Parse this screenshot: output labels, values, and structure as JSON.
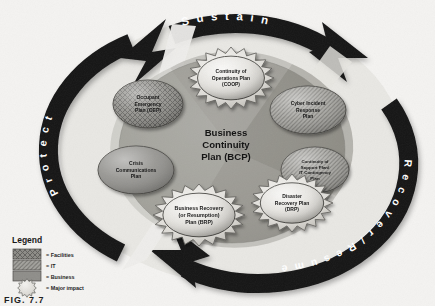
{
  "figure": {
    "caption": "FIG. 7.7",
    "center_title_lines": [
      "Business",
      "Continuity",
      "Plan (BCP)"
    ]
  },
  "ring": {
    "sustain_label": "S u s t a i n",
    "protect_label": "P r o t e c t",
    "recover_label": "R e c o v e r  /  R e s u m e",
    "ring_color": "#1a1a1a",
    "ring_text_color": "#ffffff"
  },
  "center": {
    "disc_color": "#9a9a96",
    "wedge_light": "#b9b8b3",
    "wedge_dark": "#86857f"
  },
  "nodes": [
    {
      "id": "coop",
      "lines": [
        "Continuity of",
        "Operations Plan",
        "(COOP)"
      ],
      "pattern": "facilities",
      "major_impact": true,
      "cx": 231,
      "cy": 78,
      "rx": 38,
      "ry": 26
    },
    {
      "id": "oep",
      "lines": [
        "Occupant",
        "Emergency",
        "Plan (OEP)"
      ],
      "pattern": "facilities",
      "major_impact": false,
      "cx": 148,
      "cy": 104,
      "rx": 35,
      "ry": 24
    },
    {
      "id": "cirp",
      "lines": [
        "Cyber Incident",
        "Response",
        "Plan"
      ],
      "pattern": "it",
      "major_impact": false,
      "cx": 308,
      "cy": 110,
      "rx": 38,
      "ry": 24
    },
    {
      "id": "ccp",
      "lines": [
        "Crisis",
        "Communications",
        "Plan"
      ],
      "pattern": "business",
      "major_impact": false,
      "cx": 136,
      "cy": 170,
      "rx": 38,
      "ry": 24
    },
    {
      "id": "csp",
      "lines": [
        "Continuity of",
        "Support Plan/",
        "IT Contingency",
        "Plan"
      ],
      "pattern": "it",
      "major_impact": false,
      "cx": 315,
      "cy": 170,
      "rx": 34,
      "ry": 23
    },
    {
      "id": "drp",
      "lines": [
        "Disaster",
        "Recovery Plan",
        "(DRP)"
      ],
      "pattern": "business",
      "major_impact": true,
      "cx": 292,
      "cy": 203,
      "rx": 36,
      "ry": 24
    },
    {
      "id": "brp",
      "lines": [
        "Business Recovery",
        "(or Resumption)",
        "Plan (BRP)"
      ],
      "pattern": "business",
      "major_impact": true,
      "cx": 199,
      "cy": 215,
      "rx": 41,
      "ry": 26
    }
  ],
  "legend": {
    "title": "Legend",
    "items": [
      {
        "label": "= Facilities",
        "pattern": "facilities"
      },
      {
        "label": "= IT",
        "pattern": "it"
      },
      {
        "label": "= Business",
        "pattern": "business"
      },
      {
        "label": "= Major impact",
        "pattern": "major"
      }
    ]
  }
}
